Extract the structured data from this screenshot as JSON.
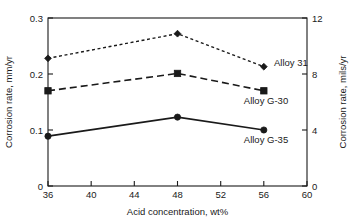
{
  "chart_data": {
    "type": "line",
    "title": "",
    "subtitle": "",
    "xlabel": "Acid concentration, wt%",
    "ylabel": "Corrosion rate, mm/yr",
    "ylabel_secondary": "Corrosion rate, mils/yr",
    "x": [
      36,
      48,
      56
    ],
    "xlim": [
      36,
      60
    ],
    "ylim": [
      0,
      0.3
    ],
    "ylim_secondary": [
      0,
      12
    ],
    "xticks": [
      "36",
      "40",
      "44",
      "48",
      "52",
      "56",
      "60"
    ],
    "xtick_values": [
      36,
      40,
      44,
      48,
      52,
      56,
      60
    ],
    "yticks": [
      "0",
      "0.1",
      "0.2",
      "0.3"
    ],
    "ytick_values": [
      0,
      0.1,
      0.2,
      0.3
    ],
    "yticks_secondary": [
      "0",
      "4",
      "8",
      "12"
    ],
    "ytick_values_secondary": [
      0,
      4,
      8,
      12
    ],
    "grid": false,
    "legend_position": "inline-right",
    "series": [
      {
        "name": "Alloy 31",
        "values": [
          0.228,
          0.272,
          0.213
        ],
        "values_secondary": [
          9.0,
          10.7,
          8.4
        ],
        "line_style": "dotted",
        "marker": "diamond",
        "color": "#1a1a1a",
        "label_x": 56,
        "label_y": 0.213
      },
      {
        "name": "Alloy G-30",
        "values": [
          0.17,
          0.201,
          0.17
        ],
        "values_secondary": [
          6.7,
          7.9,
          6.7
        ],
        "line_style": "dashed",
        "marker": "square",
        "color": "#1a1a1a",
        "label_x": 56,
        "label_y": 0.17
      },
      {
        "name": "Alloy G-35",
        "values": [
          0.089,
          0.123,
          0.1
        ],
        "values_secondary": [
          3.5,
          4.8,
          3.9
        ],
        "line_style": "solid",
        "marker": "circle",
        "color": "#1a1a1a",
        "label_x": 56,
        "label_y": 0.1
      }
    ]
  },
  "axes": {
    "x_title": "Acid concentration, wt%",
    "y_left_title": "Corrosion rate, mm/yr",
    "y_right_title": "Corrosion rate, mils/yr",
    "xtick_0": "36",
    "xtick_1": "40",
    "xtick_2": "44",
    "xtick_3": "48",
    "xtick_4": "52",
    "xtick_5": "56",
    "xtick_6": "60",
    "ytick_left_0": "0",
    "ytick_left_1": "0.1",
    "ytick_left_2": "0.2",
    "ytick_left_3": "0.3",
    "ytick_right_0": "0",
    "ytick_right_1": "4",
    "ytick_right_2": "8",
    "ytick_right_3": "12"
  },
  "series_labels": {
    "alloy_31": "Alloy 31",
    "alloy_g30": "Alloy G-30",
    "alloy_g35": "Alloy G-35"
  },
  "colors": {
    "ink": "#1a1a1a",
    "background": "#ffffff"
  }
}
